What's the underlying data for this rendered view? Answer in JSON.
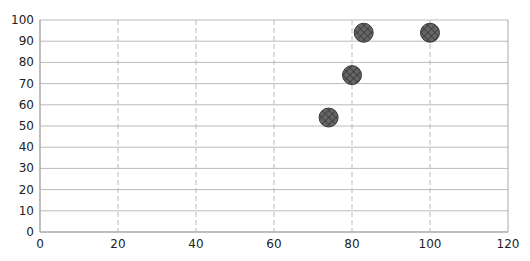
{
  "chart_data": {
    "type": "scatter",
    "title": "",
    "xlabel": "",
    "ylabel": "",
    "xlim": [
      0,
      120
    ],
    "ylim": [
      0,
      100
    ],
    "xticks": [
      0,
      20,
      40,
      60,
      80,
      100,
      120
    ],
    "yticks": [
      0,
      10,
      20,
      30,
      40,
      50,
      60,
      70,
      80,
      90,
      100
    ],
    "grid": {
      "horizontal": "solid",
      "vertical": "dashed"
    },
    "legend": null,
    "series": [
      {
        "name": "Series 1",
        "marker": "circle-crosshatch",
        "color": "#555555",
        "points": [
          {
            "x": 74,
            "y": 54
          },
          {
            "x": 80,
            "y": 74
          },
          {
            "x": 83,
            "y": 94
          },
          {
            "x": 100,
            "y": 94
          }
        ]
      }
    ]
  },
  "colors": {
    "grid_h": "#bbbbbb",
    "grid_v": "#bbbbbb",
    "axis": "#aaaaaa",
    "marker_fill": "#5a5a5a",
    "marker_stroke": "#3a3a3a"
  }
}
